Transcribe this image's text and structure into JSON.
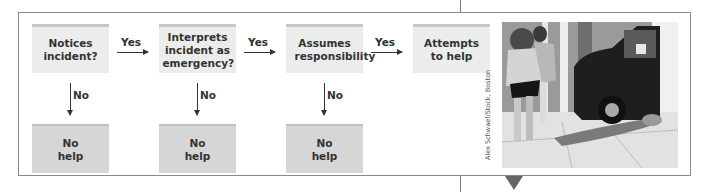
{
  "flow": {
    "steps": [
      {
        "label": "Notices incident?"
      },
      {
        "label": "Interprets incident as emergency?"
      },
      {
        "label": "Assumes responsibility"
      },
      {
        "label": "Attempts to help"
      }
    ],
    "outcomes": [
      {
        "label": "No help"
      },
      {
        "label": "No help"
      },
      {
        "label": "No help"
      }
    ],
    "yes_label": "Yes",
    "no_label": "No"
  },
  "photo": {
    "description": "Pedestrians walking past a person lying on the sidewalk next to a parked van",
    "credit": "Alex Schwaef/Stock, Boston"
  },
  "colors": {
    "step_box": "#ececec",
    "outcome_box": "#d6d6d6",
    "frame": "#8a8a8a",
    "arrow": "#333333"
  }
}
